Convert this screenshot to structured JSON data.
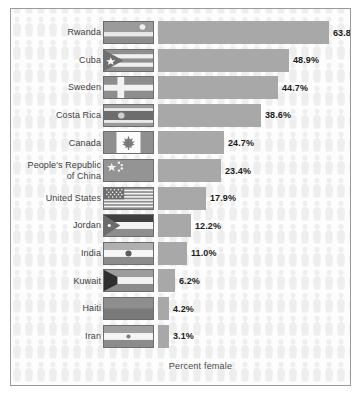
{
  "chart_data": {
    "type": "bar",
    "title": "",
    "subtitle": "",
    "xlabel": "Percent female",
    "ylabel": "",
    "orientation": "horizontal",
    "grid": false,
    "legend": "none",
    "xlim": [
      0,
      70
    ],
    "value_suffix": "%",
    "categories": [
      "Rwanda",
      "Cuba",
      "Sweden",
      "Costa Rica",
      "Canada",
      "People's Republic of China",
      "United States",
      "Jordan",
      "India",
      "Kuwait",
      "Haiti",
      "Iran"
    ],
    "values": [
      63.8,
      48.9,
      44.7,
      38.6,
      24.7,
      23.4,
      17.9,
      12.2,
      11.0,
      6.2,
      4.2,
      3.1
    ],
    "value_labels": [
      "63.8%",
      "48.9%",
      "44.7%",
      "38.6%",
      "24.7%",
      "23.4%",
      "17.9%",
      "12.2%",
      "11.0%",
      "6.2%",
      "4.2%",
      "3.1%"
    ]
  },
  "rows": [
    {
      "label_line1": "Rwanda",
      "label_line2": "",
      "value_label": "63.8%",
      "flag": "rwanda-flag"
    },
    {
      "label_line1": "Cuba",
      "label_line2": "",
      "value_label": "48.9%",
      "flag": "cuba-flag"
    },
    {
      "label_line1": "Sweden",
      "label_line2": "",
      "value_label": "44.7%",
      "flag": "sweden-flag"
    },
    {
      "label_line1": "Costa Rica",
      "label_line2": "",
      "value_label": "38.6%",
      "flag": "costa-rica-flag"
    },
    {
      "label_line1": "Canada",
      "label_line2": "",
      "value_label": "24.7%",
      "flag": "canada-flag"
    },
    {
      "label_line1": "People's Republic",
      "label_line2": "of China",
      "value_label": "23.4%",
      "flag": "china-flag"
    },
    {
      "label_line1": "United States",
      "label_line2": "",
      "value_label": "17.9%",
      "flag": "usa-flag"
    },
    {
      "label_line1": "Jordan",
      "label_line2": "",
      "value_label": "12.2%",
      "flag": "jordan-flag"
    },
    {
      "label_line1": "India",
      "label_line2": "",
      "value_label": "11.0%",
      "flag": "india-flag"
    },
    {
      "label_line1": "Kuwait",
      "label_line2": "",
      "value_label": "6.2%",
      "flag": "kuwait-flag"
    },
    {
      "label_line1": "Haiti",
      "label_line2": "",
      "value_label": "4.2%",
      "flag": "haiti-flag"
    },
    {
      "label_line1": "Iran",
      "label_line2": "",
      "value_label": "3.1%",
      "flag": "iran-flag"
    }
  ],
  "axis": {
    "label": "Percent female"
  },
  "colors": {
    "bar": "#a8a8a8",
    "frame": "#9a9a9a",
    "background": "#fdfdfd",
    "figure_pattern": "#eeeeee",
    "label_text": "#3d3d3d",
    "value_text": "#1c1c1c"
  }
}
